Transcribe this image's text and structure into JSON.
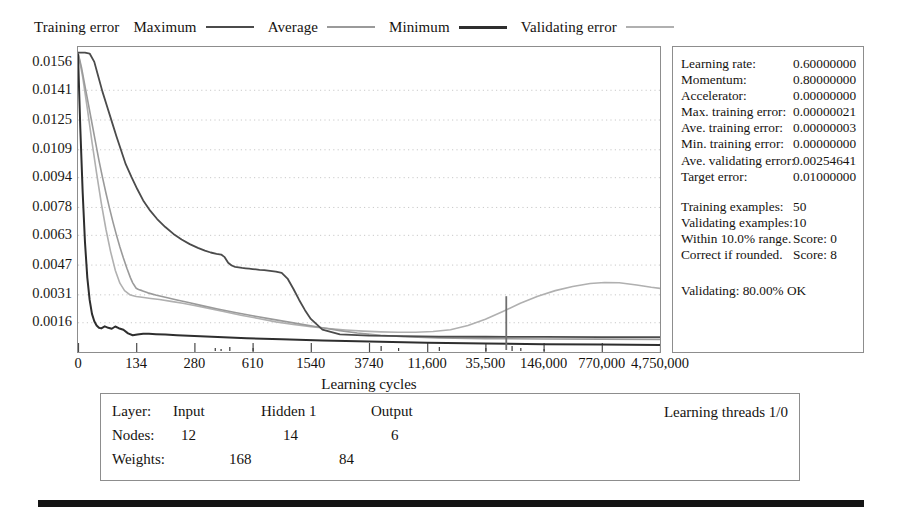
{
  "legend": {
    "title": "Training error",
    "items": [
      {
        "label": "Maximum",
        "color": "#4b4b4b",
        "key": "max"
      },
      {
        "label": "Average",
        "color": "#9a9a9a",
        "key": "avg"
      },
      {
        "label": "Minimum",
        "color": "#2e2e2e",
        "key": "min"
      },
      {
        "label": "Validating error",
        "color": "#b0b0b0",
        "key": "val"
      }
    ]
  },
  "chart_data": {
    "type": "line",
    "title": "",
    "xlabel": "Learning cycles",
    "ylabel": "",
    "grid": true,
    "legend_position": "top",
    "x_ticks": [
      "0",
      "134",
      "280",
      "610",
      "1540",
      "3740",
      "11,600",
      "35,500",
      "146,000",
      "770,000",
      "4,750,000"
    ],
    "x_tick_positions": [
      0.0,
      0.1,
      0.2,
      0.3,
      0.4,
      0.5,
      0.6,
      0.7,
      0.8,
      0.9,
      1.0
    ],
    "y_ticks": [
      "0.0156",
      "0.0141",
      "0.0125",
      "0.0109",
      "0.0094",
      "0.0078",
      "0.0063",
      "0.0047",
      "0.0031",
      "0.0016"
    ],
    "y_values": [
      0.0156,
      0.0141,
      0.0125,
      0.0109,
      0.0094,
      0.0078,
      0.0063,
      0.0047,
      0.0031,
      0.0016
    ],
    "ylim": [
      0.0,
      0.0164
    ],
    "xlim": [
      0,
      1
    ],
    "series": [
      {
        "name": "Maximum",
        "color": "#4b4b4b",
        "x": [
          0.0,
          0.012,
          0.02,
          0.028,
          0.035,
          0.042,
          0.05,
          0.058,
          0.066,
          0.074,
          0.082,
          0.092,
          0.102,
          0.112,
          0.124,
          0.136,
          0.15,
          0.164,
          0.178,
          0.192,
          0.206,
          0.218,
          0.228,
          0.238,
          0.246,
          0.252,
          0.258,
          0.264,
          0.27,
          0.276,
          0.282,
          0.288,
          0.294,
          0.3,
          0.306,
          0.312,
          0.32,
          0.33,
          0.34,
          0.35,
          0.36,
          0.37,
          0.38,
          0.39,
          0.4,
          0.42,
          0.45,
          0.5,
          0.56,
          0.62,
          0.7,
          0.8,
          0.9,
          1.0
        ],
        "y": [
          0.0161,
          0.0161,
          0.01605,
          0.0156,
          0.0148,
          0.014,
          0.0132,
          0.0124,
          0.0116,
          0.01085,
          0.0101,
          0.0094,
          0.00875,
          0.00815,
          0.0076,
          0.00715,
          0.00672,
          0.00635,
          0.00605,
          0.0058,
          0.0056,
          0.00545,
          0.00535,
          0.00528,
          0.00524,
          0.0051,
          0.0048,
          0.00465,
          0.00458,
          0.00455,
          0.00452,
          0.0045,
          0.00448,
          0.00446,
          0.00444,
          0.00442,
          0.0044,
          0.00436,
          0.00432,
          0.00425,
          0.00395,
          0.0034,
          0.0028,
          0.00225,
          0.00178,
          0.0012,
          0.00095,
          0.00088,
          0.00085,
          0.00083,
          0.00082,
          0.00081,
          0.0008,
          0.0008
        ]
      },
      {
        "name": "Average",
        "color": "#9a9a9a",
        "x": [
          0.0,
          0.006,
          0.012,
          0.018,
          0.024,
          0.03,
          0.036,
          0.042,
          0.048,
          0.054,
          0.06,
          0.066,
          0.072,
          0.078,
          0.084,
          0.09,
          0.094,
          0.098,
          0.1,
          0.104,
          0.11,
          0.12,
          0.135,
          0.15,
          0.17,
          0.19,
          0.215,
          0.24,
          0.27,
          0.3,
          0.33,
          0.36,
          0.39,
          0.42,
          0.45,
          0.48,
          0.52,
          0.56,
          0.62,
          0.7,
          0.8,
          0.9,
          1.0
        ],
        "y": [
          0.0161,
          0.0153,
          0.0143,
          0.0133,
          0.0123,
          0.0113,
          0.0103,
          0.0094,
          0.00855,
          0.00775,
          0.007,
          0.0063,
          0.00565,
          0.00505,
          0.0045,
          0.004,
          0.00372,
          0.00352,
          0.00343,
          0.00336,
          0.0033,
          0.00318,
          0.00305,
          0.00294,
          0.0028,
          0.00266,
          0.00248,
          0.00231,
          0.00212,
          0.00195,
          0.00178,
          0.00162,
          0.00146,
          0.0013,
          0.00115,
          0.00102,
          0.0009,
          0.00082,
          0.00076,
          0.00072,
          0.0007,
          0.00069,
          0.00068
        ]
      },
      {
        "name": "Minimum",
        "color": "#2e2e2e",
        "x": [
          0.0,
          0.004,
          0.008,
          0.012,
          0.016,
          0.02,
          0.024,
          0.028,
          0.032,
          0.036,
          0.04,
          0.046,
          0.052,
          0.058,
          0.064,
          0.07,
          0.078,
          0.086,
          0.094,
          0.102,
          0.112,
          0.122,
          0.134,
          0.15,
          0.17,
          0.2,
          0.24,
          0.29,
          0.35,
          0.42,
          0.5,
          0.6,
          0.7,
          0.8,
          0.9,
          1.0
        ],
        "y": [
          0.016,
          0.012,
          0.0086,
          0.0059,
          0.004,
          0.0028,
          0.00205,
          0.00165,
          0.00142,
          0.0013,
          0.00127,
          0.00138,
          0.0013,
          0.00125,
          0.00137,
          0.00128,
          0.0012,
          0.001,
          0.0009,
          0.00094,
          0.00098,
          0.00098,
          0.00096,
          0.00094,
          0.0009,
          0.00086,
          0.0008,
          0.00074,
          0.00068,
          0.00062,
          0.00056,
          0.0005,
          0.00046,
          0.00042,
          0.0004,
          0.00038
        ]
      },
      {
        "name": "Validating error",
        "color": "#b0b0b0",
        "x": [
          0.0,
          0.008,
          0.016,
          0.024,
          0.032,
          0.04,
          0.048,
          0.056,
          0.064,
          0.072,
          0.08,
          0.09,
          0.1,
          0.11,
          0.125,
          0.14,
          0.16,
          0.18,
          0.2,
          0.225,
          0.25,
          0.28,
          0.31,
          0.34,
          0.37,
          0.4,
          0.43,
          0.46,
          0.49,
          0.52,
          0.55,
          0.58,
          0.61,
          0.64,
          0.67,
          0.7,
          0.73,
          0.76,
          0.79,
          0.82,
          0.85,
          0.88,
          0.905,
          0.93,
          0.96,
          0.985,
          1.0
        ],
        "y": [
          0.0161,
          0.0148,
          0.0131,
          0.0113,
          0.0096,
          0.008,
          0.0066,
          0.0054,
          0.0044,
          0.0037,
          0.0033,
          0.00306,
          0.00298,
          0.00294,
          0.00288,
          0.00282,
          0.00272,
          0.00262,
          0.0025,
          0.00234,
          0.00218,
          0.00198,
          0.0018,
          0.00162,
          0.00148,
          0.00136,
          0.00126,
          0.00118,
          0.00112,
          0.00108,
          0.00106,
          0.00106,
          0.0011,
          0.0012,
          0.00142,
          0.00176,
          0.00218,
          0.00262,
          0.003,
          0.0033,
          0.00352,
          0.00368,
          0.00374,
          0.00372,
          0.0036,
          0.00348,
          0.00342
        ]
      }
    ],
    "annotations": [
      {
        "type": "spike",
        "x": 0.735,
        "y_top": 0.003,
        "color": "#6f6f6f",
        "name": "validating-spike"
      }
    ]
  },
  "info_panel": {
    "group1": [
      {
        "key": "Learning rate:",
        "value": "0.60000000"
      },
      {
        "key": "Momentum:",
        "value": "0.80000000"
      },
      {
        "key": "Accelerator:",
        "value": "0.00000000"
      },
      {
        "key": "Max. training error:",
        "value": "0.00000021"
      },
      {
        "key": "Ave. training error:",
        "value": "0.00000003"
      },
      {
        "key": "Min. training error:",
        "value": "0.00000000"
      },
      {
        "key": "Ave. validating error:",
        "value": "0.00254641"
      },
      {
        "key": "Target error:",
        "value": "0.01000000"
      }
    ],
    "group2": [
      {
        "key": "Training examples:",
        "value": "50"
      },
      {
        "key": "Validating examples:",
        "value": "10"
      },
      {
        "key": "Within 10.0% range.",
        "value": "Score: 0"
      },
      {
        "key": "Correct if rounded.",
        "value": "Score: 8"
      }
    ],
    "status": "Validating: 80.00% OK"
  },
  "bottom_panel": {
    "layer_label": "Layer:",
    "nodes_label": "Nodes:",
    "weights_label": "Weights:",
    "layers": [
      "Input",
      "Hidden 1",
      "Output"
    ],
    "nodes": [
      "12",
      "14",
      "6"
    ],
    "weights": [
      "168",
      "84"
    ],
    "threads": "Learning threads 1/0"
  }
}
